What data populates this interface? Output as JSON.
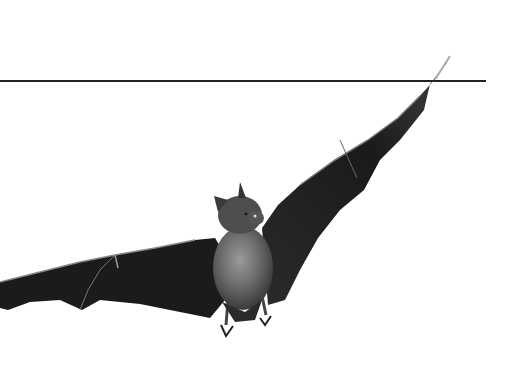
{
  "image": {
    "subject": "bat in flight",
    "background": "#ffffff",
    "line_color": "#222222",
    "wing_color": "#1c1c1c",
    "body_color": "#5a5a5a",
    "fur_highlight": "#8a8a8a"
  }
}
